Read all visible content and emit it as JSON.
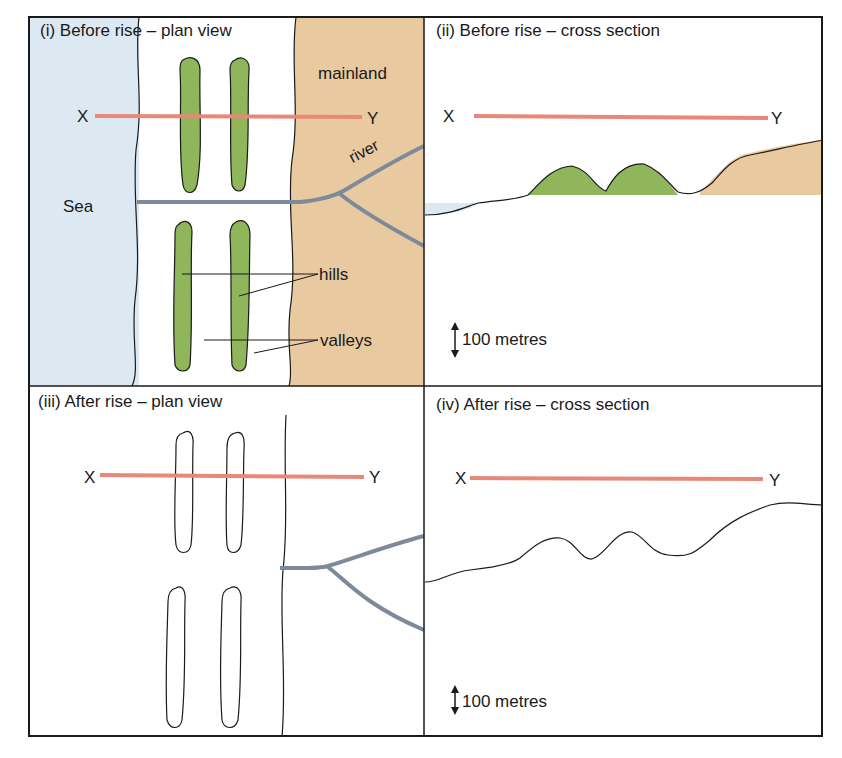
{
  "panels": {
    "p1": {
      "title": "(i) Before rise – plan view",
      "x_label": "X",
      "y_label": "Y",
      "sea": "Sea",
      "mainland": "mainland",
      "river": "river",
      "hills": "hills",
      "valleys": "valleys"
    },
    "p2": {
      "title": "(ii) Before rise – cross section",
      "x_label": "X",
      "y_label": "Y",
      "scale": "100 metres"
    },
    "p3": {
      "title": "(iii) After rise – plan view",
      "x_label": "X",
      "y_label": "Y"
    },
    "p4": {
      "title": "(iv) After rise – cross section",
      "x_label": "X",
      "y_label": "Y",
      "scale": "100 metres"
    }
  },
  "colors": {
    "sea": "#dce9f3",
    "mainland": "#e8c9a0",
    "hill": "#8fb65a",
    "river": "#7d8a99",
    "section_line": "#e8887a",
    "outline": "#1a1a1a"
  }
}
